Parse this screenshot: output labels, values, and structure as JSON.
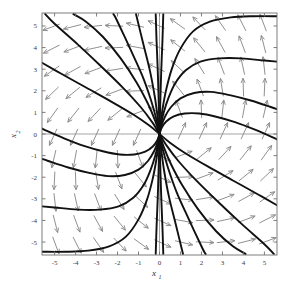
{
  "figure": {
    "kind": "phase-portrait",
    "background_color": "#ffffff",
    "frame_color": "#6f6f6f",
    "zeroline_color": "#9a9a9a",
    "trajectory_color": "#111111",
    "arrow_color": "#8a8a8a"
  },
  "chart_data": {
    "type": "line",
    "title": "",
    "subtitle": "",
    "xlabel": "x_1",
    "ylabel": "x_2",
    "xlim": [
      -5.6,
      5.6
    ],
    "ylim": [
      -5.6,
      5.6
    ],
    "grid": false,
    "legend": "none",
    "zero_lines": {
      "x": 0,
      "y": 0
    },
    "xticks": [
      -5,
      -4,
      -3,
      -2,
      -1,
      0,
      1,
      2,
      3,
      4,
      5
    ],
    "yticks": [
      -5,
      -4,
      -3,
      -2,
      -1,
      0,
      1,
      2,
      3,
      4,
      5
    ],
    "xtick_labels": [
      "-5",
      "-4",
      "-3",
      "-2",
      "-1",
      "0",
      "1",
      "2",
      "3",
      "4",
      "5"
    ],
    "ytick_labels": [
      "-5",
      "-4",
      "-3",
      "-2",
      "-1",
      "0",
      "1",
      "2",
      "3",
      "4",
      "5"
    ],
    "fixed_point": {
      "x": 0,
      "y": 0,
      "classification": "unstable-node"
    },
    "flow_direction": "outward-from-origin",
    "trajectories": [
      {
        "name": "t-ur-1",
        "points": [
          [
            0.0,
            0.0
          ],
          [
            0.06,
            0.55
          ],
          [
            0.16,
            1.25
          ],
          [
            0.33,
            2.1
          ],
          [
            0.6,
            3.05
          ],
          [
            1.0,
            3.95
          ],
          [
            1.6,
            4.75
          ],
          [
            2.4,
            5.2
          ],
          [
            3.4,
            5.4
          ],
          [
            4.5,
            5.45
          ],
          [
            5.6,
            5.45
          ]
        ]
      },
      {
        "name": "t-ur-2",
        "points": [
          [
            0.0,
            0.0
          ],
          [
            0.07,
            0.45
          ],
          [
            0.2,
            1.0
          ],
          [
            0.42,
            1.65
          ],
          [
            0.75,
            2.35
          ],
          [
            1.25,
            2.95
          ],
          [
            1.95,
            3.35
          ],
          [
            2.85,
            3.5
          ],
          [
            3.9,
            3.5
          ],
          [
            5.0,
            3.4
          ],
          [
            5.6,
            3.35
          ]
        ]
      },
      {
        "name": "t-ur-3",
        "points": [
          [
            0.0,
            0.0
          ],
          [
            0.09,
            0.38
          ],
          [
            0.26,
            0.8
          ],
          [
            0.55,
            1.25
          ],
          [
            1.0,
            1.65
          ],
          [
            1.65,
            1.9
          ],
          [
            2.45,
            1.95
          ],
          [
            3.35,
            1.8
          ],
          [
            4.35,
            1.55
          ],
          [
            5.3,
            1.25
          ],
          [
            5.6,
            1.15
          ]
        ]
      },
      {
        "name": "t-ur-4",
        "points": [
          [
            0.0,
            0.0
          ],
          [
            0.11,
            0.3
          ],
          [
            0.32,
            0.58
          ],
          [
            0.68,
            0.82
          ],
          [
            1.2,
            0.95
          ],
          [
            1.9,
            0.95
          ],
          [
            2.7,
            0.8
          ],
          [
            3.6,
            0.55
          ],
          [
            4.55,
            0.2
          ],
          [
            5.5,
            -0.2
          ],
          [
            5.6,
            -0.25
          ]
        ]
      },
      {
        "name": "t-ll-1",
        "points": [
          [
            0.0,
            0.0
          ],
          [
            -0.06,
            -0.55
          ],
          [
            -0.16,
            -1.25
          ],
          [
            -0.33,
            -2.1
          ],
          [
            -0.6,
            -3.05
          ],
          [
            -1.0,
            -3.95
          ],
          [
            -1.6,
            -4.75
          ],
          [
            -2.4,
            -5.2
          ],
          [
            -3.4,
            -5.4
          ],
          [
            -4.5,
            -5.45
          ],
          [
            -5.6,
            -5.45
          ]
        ]
      },
      {
        "name": "t-ll-2",
        "points": [
          [
            0.0,
            0.0
          ],
          [
            -0.07,
            -0.45
          ],
          [
            -0.2,
            -1.0
          ],
          [
            -0.42,
            -1.65
          ],
          [
            -0.75,
            -2.35
          ],
          [
            -1.25,
            -2.95
          ],
          [
            -1.95,
            -3.35
          ],
          [
            -2.85,
            -3.5
          ],
          [
            -3.9,
            -3.5
          ],
          [
            -5.0,
            -3.4
          ],
          [
            -5.6,
            -3.35
          ]
        ]
      },
      {
        "name": "t-ll-3",
        "points": [
          [
            0.0,
            0.0
          ],
          [
            -0.09,
            -0.38
          ],
          [
            -0.26,
            -0.8
          ],
          [
            -0.55,
            -1.25
          ],
          [
            -1.0,
            -1.65
          ],
          [
            -1.65,
            -1.9
          ],
          [
            -2.45,
            -1.95
          ],
          [
            -3.35,
            -1.8
          ],
          [
            -4.35,
            -1.55
          ],
          [
            -5.3,
            -1.25
          ],
          [
            -5.6,
            -1.15
          ]
        ]
      },
      {
        "name": "t-ll-4",
        "points": [
          [
            0.0,
            0.0
          ],
          [
            -0.11,
            -0.3
          ],
          [
            -0.32,
            -0.58
          ],
          [
            -0.68,
            -0.82
          ],
          [
            -1.2,
            -0.95
          ],
          [
            -1.9,
            -0.95
          ],
          [
            -2.7,
            -0.8
          ],
          [
            -3.6,
            -0.55
          ],
          [
            -4.55,
            -0.2
          ],
          [
            -5.5,
            0.2
          ],
          [
            -5.6,
            0.25
          ]
        ]
      },
      {
        "name": "t-ul-1",
        "points": [
          [
            0.0,
            0.0
          ],
          [
            -0.2,
            0.6
          ],
          [
            -0.55,
            1.4
          ],
          [
            -1.1,
            2.4
          ],
          [
            -1.85,
            3.5
          ],
          [
            -2.7,
            4.5
          ],
          [
            -3.5,
            5.2
          ],
          [
            -4.1,
            5.55
          ]
        ]
      },
      {
        "name": "t-ul-2",
        "points": [
          [
            0.0,
            0.0
          ],
          [
            -0.35,
            0.55
          ],
          [
            -0.9,
            1.25
          ],
          [
            -1.75,
            2.15
          ],
          [
            -2.8,
            3.15
          ],
          [
            -3.9,
            4.15
          ],
          [
            -5.0,
            5.1
          ],
          [
            -5.45,
            5.55
          ]
        ]
      },
      {
        "name": "t-ul-3",
        "points": [
          [
            0.0,
            0.0
          ],
          [
            -0.5,
            0.4
          ],
          [
            -1.25,
            0.9
          ],
          [
            -2.3,
            1.5
          ],
          [
            -3.5,
            2.15
          ],
          [
            -4.7,
            2.8
          ],
          [
            -5.6,
            3.3
          ]
        ]
      },
      {
        "name": "t-lr-1",
        "points": [
          [
            0.0,
            0.0
          ],
          [
            0.2,
            -0.6
          ],
          [
            0.55,
            -1.4
          ],
          [
            1.1,
            -2.4
          ],
          [
            1.85,
            -3.5
          ],
          [
            2.7,
            -4.5
          ],
          [
            3.5,
            -5.2
          ],
          [
            4.1,
            -5.55
          ]
        ]
      },
      {
        "name": "t-lr-2",
        "points": [
          [
            0.0,
            0.0
          ],
          [
            0.35,
            -0.55
          ],
          [
            0.9,
            -1.25
          ],
          [
            1.75,
            -2.15
          ],
          [
            2.8,
            -3.15
          ],
          [
            3.9,
            -4.15
          ],
          [
            5.0,
            -5.1
          ],
          [
            5.45,
            -5.55
          ]
        ]
      },
      {
        "name": "t-lr-3",
        "points": [
          [
            0.0,
            0.0
          ],
          [
            0.5,
            -0.4
          ],
          [
            1.25,
            -0.9
          ],
          [
            2.3,
            -1.5
          ],
          [
            3.5,
            -2.15
          ],
          [
            4.7,
            -2.8
          ],
          [
            5.6,
            -3.3
          ]
        ]
      },
      {
        "name": "t-axis-up",
        "points": [
          [
            0.0,
            0.0
          ],
          [
            -0.02,
            0.8
          ],
          [
            -0.05,
            1.9
          ],
          [
            -0.09,
            3.1
          ],
          [
            -0.14,
            4.3
          ],
          [
            -0.18,
            5.55
          ]
        ]
      },
      {
        "name": "t-axis-up2",
        "points": [
          [
            0.0,
            0.0
          ],
          [
            0.02,
            0.8
          ],
          [
            0.05,
            1.9
          ],
          [
            0.09,
            3.1
          ],
          [
            0.14,
            4.3
          ],
          [
            0.18,
            5.55
          ]
        ]
      },
      {
        "name": "t-axis-dn",
        "points": [
          [
            0.0,
            0.0
          ],
          [
            0.02,
            -0.8
          ],
          [
            0.05,
            -1.9
          ],
          [
            0.09,
            -3.1
          ],
          [
            0.14,
            -4.3
          ],
          [
            0.18,
            -5.55
          ]
        ]
      },
      {
        "name": "t-axis-dn2",
        "points": [
          [
            0.0,
            0.0
          ],
          [
            -0.02,
            -0.8
          ],
          [
            -0.05,
            -1.9
          ],
          [
            -0.09,
            -3.1
          ],
          [
            -0.14,
            -4.3
          ],
          [
            -0.18,
            -5.55
          ]
        ]
      },
      {
        "name": "t-near-up-a",
        "points": [
          [
            0.0,
            0.0
          ],
          [
            -0.08,
            0.7
          ],
          [
            -0.22,
            1.7
          ],
          [
            -0.45,
            2.9
          ],
          [
            -0.78,
            4.2
          ],
          [
            -1.12,
            5.55
          ]
        ]
      },
      {
        "name": "t-near-up-b",
        "points": [
          [
            0.0,
            0.0
          ],
          [
            -0.14,
            0.65
          ],
          [
            -0.4,
            1.55
          ],
          [
            -0.82,
            2.7
          ],
          [
            -1.4,
            3.95
          ],
          [
            -2.05,
            5.3
          ],
          [
            -2.2,
            5.55
          ]
        ]
      },
      {
        "name": "t-near-dn-a",
        "points": [
          [
            0.0,
            0.0
          ],
          [
            0.08,
            -0.7
          ],
          [
            0.22,
            -1.7
          ],
          [
            0.45,
            -2.9
          ],
          [
            0.78,
            -4.2
          ],
          [
            1.12,
            -5.55
          ]
        ]
      },
      {
        "name": "t-near-dn-b",
        "points": [
          [
            0.0,
            0.0
          ],
          [
            0.14,
            -0.65
          ],
          [
            0.4,
            -1.55
          ],
          [
            0.82,
            -2.7
          ],
          [
            1.4,
            -3.95
          ],
          [
            2.05,
            -5.3
          ],
          [
            2.2,
            -5.55
          ]
        ]
      }
    ],
    "quiver": {
      "grid_x": [
        -5.0,
        -4.0,
        -3.0,
        -2.0,
        -1.0,
        0.0,
        1.0,
        2.0,
        3.0,
        4.0,
        5.0
      ],
      "grid_y": [
        5.0,
        4.0,
        3.0,
        2.0,
        1.0,
        0.0,
        -1.0,
        -2.0,
        -3.0,
        -4.0,
        -5.0
      ],
      "rule": "arrow direction follows the streamline through each grid point; up-left in quadrant II, right/up-right in quadrant I, down-right in quadrant IV, left/down-left in quadrant III",
      "color": "#8a8a8a"
    }
  }
}
